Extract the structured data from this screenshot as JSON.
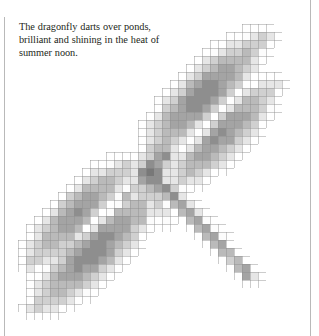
{
  "page": {
    "width": 319,
    "height": 336,
    "background_color": "#ffffff",
    "rules": {
      "left_rule_color": "#b9b9b9",
      "right_rule_color": "#b9b9b9"
    }
  },
  "caption": {
    "text": "The dragonfly darts over ponds, brilliant and shining in the heat of summer noon.",
    "color": "#231f20"
  },
  "figure": {
    "subject": "dragonfly",
    "style": "pixelated halftone with square grid overlay",
    "grid_cell_size": 8,
    "grid_line_color": "#8d8d8d",
    "ink_color": "#6f6f6f",
    "bounds": {
      "x": 10,
      "y": 16,
      "width": 288,
      "height": 296
    }
  }
}
